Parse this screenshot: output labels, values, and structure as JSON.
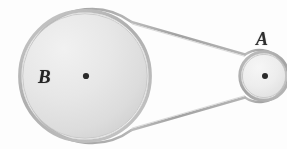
{
  "figure": {
    "type": "mechanical-diagram",
    "background_color": "#fdfdfd",
    "ink_color": "#2b2b2b",
    "labels": {
      "large_pulley": "B",
      "small_pulley": "A"
    },
    "elements": {
      "large_pulley": {
        "name": "B",
        "center_x": 85,
        "center_y": 76,
        "radius": 65,
        "rim_color": "#b9b9b9",
        "face_color": "#e4e4e4",
        "hub_color": "#2a2a2a",
        "hub_radius": 3.1
      },
      "small_pulley": {
        "name": "A",
        "center_x": 264,
        "center_y": 76,
        "radius": 24,
        "rim_color": "#b0b0b0",
        "face_color": "#ececec",
        "hub_color": "#2a2a2a",
        "hub_radius": 3.0
      },
      "belt": {
        "name": "drive-belt",
        "color": "#a8a8a8",
        "width": 2.4,
        "upper_span": {
          "x1": 131,
          "y1": 22,
          "x2": 245,
          "y2": 54
        },
        "lower_span": {
          "x1": 131,
          "y1": 130,
          "x2": 245,
          "y2": 98
        }
      }
    }
  }
}
